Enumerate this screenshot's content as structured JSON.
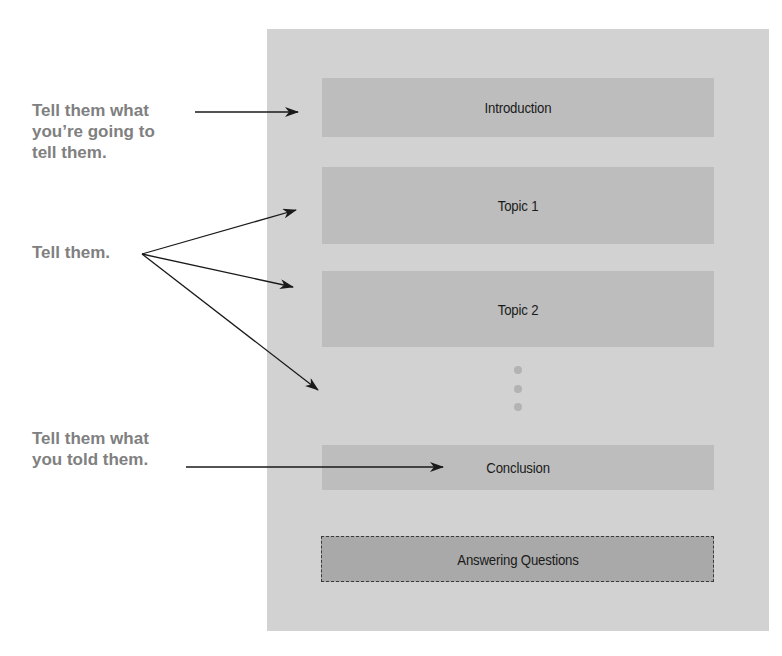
{
  "diagram": {
    "colors": {
      "panel": "#d2d2d2",
      "box": "#bdbdbd",
      "box_emphasis": "#a9a9a9",
      "label_text": "#808080",
      "box_text": "#1a1a1a",
      "arrow": "#1a1a1a",
      "dots": "#b3b3b3"
    },
    "boxes": [
      {
        "id": "introduction",
        "label": "Introduction"
      },
      {
        "id": "topic-1",
        "label": "Topic 1"
      },
      {
        "id": "topic-2",
        "label": "Topic 2"
      },
      {
        "id": "conclusion",
        "label": "Conclusion"
      },
      {
        "id": "answering-questions",
        "label": "Answering Questions",
        "style": "dashed"
      }
    ],
    "ellipsis": {
      "count": 3,
      "meaning": "more topics"
    },
    "annotations": [
      {
        "id": "intro-note",
        "text": "Tell them what\nyou’re going to\ntell them.",
        "points_to": [
          "introduction"
        ]
      },
      {
        "id": "body-note",
        "text": "Tell them.",
        "points_to": [
          "topic-1",
          "topic-2",
          "more-topics"
        ]
      },
      {
        "id": "conclusion-note",
        "text": "Tell them what\nyou told them.",
        "points_to": [
          "conclusion"
        ]
      }
    ]
  }
}
